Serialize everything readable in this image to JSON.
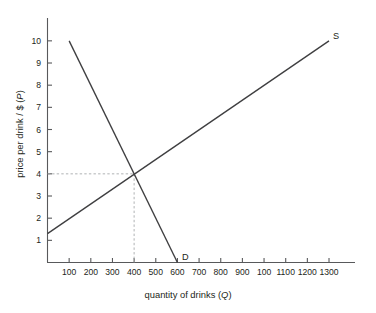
{
  "chart_data": {
    "type": "line",
    "title": "",
    "xlabel": "quantity of drinks (Q)",
    "ylabel": "price per drink / $ (P)",
    "xlim": [
      0,
      1350
    ],
    "ylim": [
      0,
      10.6
    ],
    "grid": false,
    "legend_position": "inline-curve-end",
    "x_ticks": [
      100,
      200,
      300,
      400,
      500,
      600,
      700,
      800,
      900,
      1000,
      1100,
      1200,
      1300
    ],
    "x_tick_labels": [
      "100",
      "200",
      "300",
      "400",
      "500",
      "600",
      "700",
      "800",
      "900",
      "100",
      "1100",
      "1200",
      "1300"
    ],
    "y_ticks": [
      1,
      2,
      3,
      4,
      5,
      6,
      7,
      8,
      9,
      10
    ],
    "y_tick_labels": [
      "1",
      "2",
      "3",
      "4",
      "5",
      "6",
      "7",
      "8",
      "9",
      "10"
    ],
    "series": [
      {
        "name": "D",
        "label": "D",
        "description": "demand curve, downward sloping",
        "color": "#3f3f41",
        "points": [
          [
            100,
            10.0
          ],
          [
            600,
            0.0
          ]
        ]
      },
      {
        "name": "S",
        "label": "S",
        "description": "supply curve, upward sloping",
        "color": "#3f3f41",
        "points": [
          [
            0,
            1.3
          ],
          [
            1300,
            10.0
          ]
        ]
      }
    ],
    "annotations": [
      {
        "name": "equilibrium",
        "x": 400,
        "y": 4,
        "guide_color": "#a7a9ac",
        "guide_style": "dashed"
      }
    ]
  },
  "labels": {
    "x_axis_title_text": "quantity of drinks (",
    "x_axis_title_var": "Q",
    "x_axis_title_tail": ")",
    "y_axis_title_text": "price per drink / $ (",
    "y_axis_title_var": "P",
    "y_axis_title_tail": ")"
  }
}
